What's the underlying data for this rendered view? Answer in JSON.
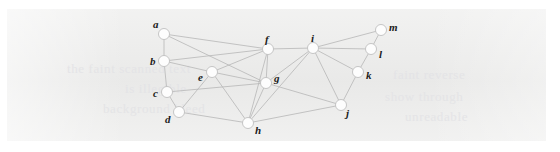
{
  "figure": {
    "panel": {
      "background_color": "#ececeb",
      "page_background_color": "#ffffff",
      "x": 7,
      "y": 9,
      "width": 539,
      "height": 132
    },
    "style": {
      "node_fill": "#fdfdfd",
      "node_stroke": "#c0c0c0",
      "node_radius": 5.5,
      "edge_color": "#b6b6b6",
      "edge_width": 0.8,
      "label_color": "#1b1b1b"
    }
  },
  "watermark": {
    "lines": [
      {
        "text": "the faint scanned text",
        "x": 60,
        "y": 52
      },
      {
        "text": "is illegible",
        "x": 118,
        "y": 72
      },
      {
        "text": "background bleed",
        "x": 96,
        "y": 92
      },
      {
        "text": "faint reverse",
        "x": 386,
        "y": 58
      },
      {
        "text": "show through",
        "x": 378,
        "y": 80
      },
      {
        "text": "unreadable",
        "x": 398,
        "y": 100
      }
    ]
  },
  "graph": {
    "nodes": [
      {
        "id": "a",
        "label": "a",
        "x": 157,
        "y": 25,
        "label_dx": -11,
        "label_dy": -15
      },
      {
        "id": "b",
        "label": "b",
        "x": 157,
        "y": 52,
        "label_dx": -14,
        "label_dy": -5
      },
      {
        "id": "c",
        "label": "c",
        "x": 160,
        "y": 83,
        "label_dx": -14,
        "label_dy": -4
      },
      {
        "id": "d",
        "label": "d",
        "x": 172,
        "y": 103,
        "label_dx": -14,
        "label_dy": 2
      },
      {
        "id": "e",
        "label": "e",
        "x": 205,
        "y": 63,
        "label_dx": -14,
        "label_dy": 0
      },
      {
        "id": "f",
        "label": "f",
        "x": 261,
        "y": 40,
        "label_dx": -3,
        "label_dy": -15
      },
      {
        "id": "g",
        "label": "g",
        "x": 259,
        "y": 74,
        "label_dx": 8,
        "label_dy": -10
      },
      {
        "id": "h",
        "label": "h",
        "x": 241,
        "y": 114,
        "label_dx": 7,
        "label_dy": 2
      },
      {
        "id": "i",
        "label": "i",
        "x": 306,
        "y": 39,
        "label_dx": -2,
        "label_dy": -15
      },
      {
        "id": "j",
        "label": "j",
        "x": 334,
        "y": 96,
        "label_dx": 5,
        "label_dy": 3
      },
      {
        "id": "k",
        "label": "k",
        "x": 351,
        "y": 63,
        "label_dx": 8,
        "label_dy": -2
      },
      {
        "id": "l",
        "label": "l",
        "x": 364,
        "y": 40,
        "label_dx": 8,
        "label_dy": 0
      },
      {
        "id": "m",
        "label": "m",
        "x": 374,
        "y": 21,
        "label_dx": 8,
        "label_dy": -8
      }
    ],
    "edges": [
      {
        "source": "a",
        "target": "b"
      },
      {
        "source": "a",
        "target": "f"
      },
      {
        "source": "a",
        "target": "g"
      },
      {
        "source": "b",
        "target": "c"
      },
      {
        "source": "b",
        "target": "e"
      },
      {
        "source": "b",
        "target": "f"
      },
      {
        "source": "c",
        "target": "d"
      },
      {
        "source": "c",
        "target": "g"
      },
      {
        "source": "d",
        "target": "e"
      },
      {
        "source": "d",
        "target": "h"
      },
      {
        "source": "e",
        "target": "f"
      },
      {
        "source": "e",
        "target": "g"
      },
      {
        "source": "e",
        "target": "h"
      },
      {
        "source": "f",
        "target": "g"
      },
      {
        "source": "f",
        "target": "i"
      },
      {
        "source": "f",
        "target": "h"
      },
      {
        "source": "g",
        "target": "h"
      },
      {
        "source": "g",
        "target": "i"
      },
      {
        "source": "g",
        "target": "j"
      },
      {
        "source": "h",
        "target": "i"
      },
      {
        "source": "h",
        "target": "j"
      },
      {
        "source": "i",
        "target": "j"
      },
      {
        "source": "i",
        "target": "k"
      },
      {
        "source": "i",
        "target": "l"
      },
      {
        "source": "i",
        "target": "m"
      },
      {
        "source": "j",
        "target": "k"
      },
      {
        "source": "k",
        "target": "l"
      },
      {
        "source": "l",
        "target": "m"
      }
    ]
  }
}
